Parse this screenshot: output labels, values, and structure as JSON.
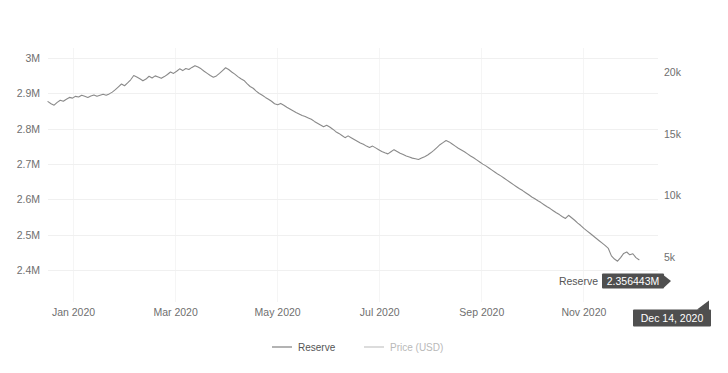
{
  "chart_data": {
    "type": "line",
    "title": "",
    "subtitle": "",
    "xlabel": "",
    "ylabel": "",
    "grid": true,
    "legend_position": "bottom",
    "x_tick_labels": [
      "Jan 2020",
      "Mar 2020",
      "May 2020",
      "Jul 2020",
      "Sep 2020",
      "Nov 2020"
    ],
    "x_tick_positions": [
      0.5,
      2.5,
      4.5,
      6.5,
      8.5,
      10.5
    ],
    "x_range": [
      0,
      11.6
    ],
    "axes": [
      {
        "id": "left",
        "name": "Reserve",
        "tick_labels": [
          "3M",
          "2.9M",
          "2.8M",
          "2.7M",
          "2.6M",
          "2.5M",
          "2.4M"
        ],
        "tick_values": [
          3000000,
          2900000,
          2800000,
          2700000,
          2600000,
          2500000,
          2400000
        ],
        "range": [
          2350000,
          3030000
        ]
      },
      {
        "id": "right",
        "name": "Price (USD)",
        "tick_labels": [
          "20k",
          "15k",
          "10k",
          "5k"
        ],
        "tick_values": [
          20000,
          15000,
          10000,
          5000
        ],
        "range": [
          2500,
          22000
        ]
      }
    ],
    "series": [
      {
        "name": "Reserve",
        "axis": "left",
        "color": "#8a8a8a",
        "visible": true,
        "x": [
          0.0,
          0.06,
          0.12,
          0.18,
          0.24,
          0.3,
          0.36,
          0.42,
          0.48,
          0.54,
          0.6,
          0.66,
          0.72,
          0.78,
          0.84,
          0.9,
          0.96,
          1.02,
          1.08,
          1.14,
          1.2,
          1.26,
          1.32,
          1.38,
          1.44,
          1.5,
          1.56,
          1.62,
          1.68,
          1.74,
          1.8,
          1.86,
          1.92,
          1.98,
          2.04,
          2.1,
          2.16,
          2.22,
          2.28,
          2.34,
          2.4,
          2.46,
          2.52,
          2.58,
          2.64,
          2.7,
          2.76,
          2.82,
          2.88,
          2.94,
          3.0,
          3.06,
          3.12,
          3.18,
          3.24,
          3.3,
          3.36,
          3.42,
          3.48,
          3.54,
          3.6,
          3.66,
          3.72,
          3.78,
          3.84,
          3.9,
          3.96,
          4.02,
          4.08,
          4.14,
          4.2,
          4.26,
          4.32,
          4.38,
          4.44,
          4.5,
          4.56,
          4.62,
          4.68,
          4.74,
          4.8,
          4.86,
          4.92,
          4.98,
          5.04,
          5.1,
          5.16,
          5.22,
          5.28,
          5.34,
          5.4,
          5.46,
          5.52,
          5.58,
          5.64,
          5.7,
          5.76,
          5.82,
          5.88,
          5.94,
          6.0,
          6.06,
          6.12,
          6.18,
          6.24,
          6.3,
          6.36,
          6.42,
          6.48,
          6.54,
          6.6,
          6.66,
          6.72,
          6.78,
          6.84,
          6.9,
          6.96,
          7.02,
          7.08,
          7.14,
          7.2,
          7.26,
          7.32,
          7.38,
          7.44,
          7.5,
          7.56,
          7.62,
          7.68,
          7.74,
          7.8,
          7.86,
          7.92,
          7.98,
          8.04,
          8.1,
          8.16,
          8.22,
          8.28,
          8.34,
          8.4,
          8.46,
          8.52,
          8.58,
          8.64,
          8.7,
          8.76,
          8.82,
          8.88,
          8.94,
          9.0,
          9.06,
          9.12,
          9.18,
          9.24,
          9.3,
          9.36,
          9.42,
          9.48,
          9.54,
          9.6,
          9.66,
          9.72,
          9.78,
          9.84,
          9.9,
          9.96,
          10.02,
          10.08,
          10.14,
          10.2,
          10.26,
          10.32,
          10.38,
          10.44,
          10.5,
          10.56,
          10.62,
          10.68,
          10.74,
          10.8,
          10.86,
          10.92,
          10.98,
          11.04,
          11.1,
          11.16,
          11.22,
          11.28,
          11.34,
          11.4,
          11.46,
          11.52,
          11.58
        ],
        "y": [
          2878000,
          2872000,
          2868000,
          2876000,
          2882000,
          2879000,
          2885000,
          2890000,
          2888000,
          2893000,
          2891000,
          2896000,
          2893000,
          2890000,
          2894000,
          2897000,
          2893000,
          2896000,
          2899000,
          2896000,
          2900000,
          2905000,
          2912000,
          2920000,
          2928000,
          2923000,
          2931000,
          2940000,
          2952000,
          2948000,
          2943000,
          2937000,
          2942000,
          2950000,
          2945000,
          2951000,
          2948000,
          2944000,
          2949000,
          2955000,
          2962000,
          2958000,
          2964000,
          2971000,
          2966000,
          2972000,
          2969000,
          2975000,
          2980000,
          2976000,
          2971000,
          2964000,
          2958000,
          2952000,
          2947000,
          2951000,
          2958000,
          2966000,
          2974000,
          2969000,
          2962000,
          2956000,
          2949000,
          2943000,
          2938000,
          2929000,
          2921000,
          2916000,
          2908000,
          2901000,
          2896000,
          2890000,
          2885000,
          2879000,
          2872000,
          2869000,
          2873000,
          2868000,
          2862000,
          2857000,
          2852000,
          2847000,
          2843000,
          2839000,
          2836000,
          2832000,
          2828000,
          2822000,
          2817000,
          2812000,
          2807000,
          2811000,
          2806000,
          2800000,
          2793000,
          2788000,
          2782000,
          2776000,
          2781000,
          2776000,
          2771000,
          2766000,
          2761000,
          2757000,
          2752000,
          2748000,
          2752000,
          2747000,
          2742000,
          2737000,
          2733000,
          2730000,
          2736000,
          2742000,
          2737000,
          2732000,
          2728000,
          2724000,
          2721000,
          2718000,
          2716000,
          2714000,
          2718000,
          2722000,
          2727000,
          2733000,
          2740000,
          2748000,
          2756000,
          2762000,
          2768000,
          2764000,
          2758000,
          2752000,
          2746000,
          2741000,
          2736000,
          2730000,
          2724000,
          2719000,
          2713000,
          2707000,
          2701000,
          2696000,
          2690000,
          2684000,
          2678000,
          2672000,
          2667000,
          2661000,
          2655000,
          2649000,
          2643000,
          2637000,
          2631000,
          2626000,
          2620000,
          2614000,
          2608000,
          2603000,
          2597000,
          2592000,
          2586000,
          2580000,
          2575000,
          2569000,
          2563000,
          2558000,
          2552000,
          2547000,
          2556000,
          2549000,
          2542000,
          2534000,
          2527000,
          2519000,
          2512000,
          2505000,
          2498000,
          2491000,
          2484000,
          2477000,
          2470000,
          2462000,
          2441000,
          2432000,
          2426000,
          2436000,
          2448000,
          2452000,
          2444000,
          2447000,
          2436000,
          2430000
        ]
      },
      {
        "name": "Price (USD)",
        "axis": "right",
        "color": "#cfd8e3",
        "visible": false,
        "x": [],
        "y": []
      }
    ],
    "annotations": [
      {
        "type": "tooltip-value",
        "series": "Reserve",
        "label": "Reserve",
        "value_text": "2.356443M",
        "value": 2356443,
        "x_px": 632,
        "y_px": 281
      },
      {
        "type": "tooltip-date",
        "value_text": "Dec 14, 2020",
        "x_px": 672,
        "y_px": 318
      }
    ]
  },
  "legend": {
    "items": [
      {
        "label": "Reserve",
        "color": "#8a8a8a"
      },
      {
        "label": "Price (USD)",
        "color": "#c9c9c9"
      }
    ]
  },
  "tooltips": {
    "reserve_label": "Reserve",
    "reserve_value": "2.356443M",
    "date_value": "Dec 14, 2020"
  },
  "colors": {
    "background": "#ffffff",
    "grid": "#f0f0f0",
    "axis_text": "#6f6f6f",
    "reserve_line": "#8a8a8a",
    "price_line": "#c9c9c9",
    "tooltip_bg": "#4f4f4f",
    "tooltip_text": "#ffffff"
  }
}
